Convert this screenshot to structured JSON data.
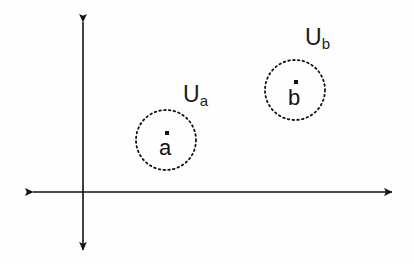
{
  "figure": {
    "background_color": "#fefefe",
    "ink_color": "#111111",
    "width": 414,
    "height": 264
  },
  "axes": {
    "origin": {
      "x": 83,
      "y": 192
    },
    "horizontal": {
      "name": "horizontal-axis",
      "from_x": 33,
      "to_x": 392,
      "y": 192,
      "arrow_start": true,
      "arrow_end": true,
      "stroke_width": 1.6
    },
    "vertical": {
      "name": "vertical-axis",
      "x": 83,
      "from_y": 22,
      "to_y": 250,
      "arrow_start": true,
      "arrow_end": true,
      "stroke_width": 1.6
    }
  },
  "neighborhoods": [
    {
      "id": "ua",
      "label_base": "U",
      "label_sub": "a",
      "label_x": 183,
      "label_y": 83,
      "circle": {
        "cx": 166,
        "cy": 140,
        "r": 30
      },
      "dash_pattern": "1.6 3.2",
      "point": {
        "letter": "a",
        "letter_x": 159,
        "letter_y": 137,
        "dot_x": 165,
        "dot_y": 131
      }
    },
    {
      "id": "ub",
      "label_base": "U",
      "label_sub": "b",
      "label_x": 305,
      "label_y": 26,
      "circle": {
        "cx": 295,
        "cy": 90,
        "r": 30
      },
      "dash_pattern": "1.6 3.2",
      "point": {
        "letter": "b",
        "letter_x": 288,
        "letter_y": 87,
        "dot_x": 294,
        "dot_y": 80
      }
    }
  ]
}
